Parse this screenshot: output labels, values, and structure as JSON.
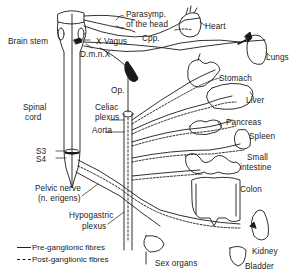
{
  "diagram": {
    "type": "anatomical-line-drawing",
    "labels": {
      "brain_stem": "Brain stem",
      "parasymp_line1": "Parasymp.",
      "parasymp_line2": "of the head",
      "heart": "Heart",
      "x_vagus": "X Vagus",
      "cpp": "Cpp.",
      "lungs": "Lungs",
      "dmnx": "D.m.n.X",
      "op": "Op.",
      "stomach": "Stomach",
      "spinal_line1": "Spinal",
      "spinal_line2": "cord",
      "celiac_line1": "Celiac",
      "celiac_line2": "plexus",
      "aorta": "Aorta",
      "liver": "Liver",
      "pancreas": "Pancreas",
      "spleen": "Spleen",
      "s3": "S3",
      "s4": "S4",
      "small_intestine_line1": "Small",
      "small_intestine_line2": "intestine",
      "colon": "Colon",
      "pelvic_line1": "Pelvic nerve",
      "pelvic_line2": "(n. erigens)",
      "hypogastric_line1": "Hypogastric",
      "hypogastric_line2": "plexus",
      "kidney": "Kidney",
      "sex_organs": "Sex organs",
      "bladder": "Bladder"
    },
    "legend": [
      {
        "style": "solid",
        "label": "Pre-ganglionic fibres"
      },
      {
        "style": "dashed",
        "label": "Post-ganglionic fibres"
      }
    ],
    "colors": {
      "ink": "#1a1a1a",
      "background": "#ffffff"
    }
  }
}
